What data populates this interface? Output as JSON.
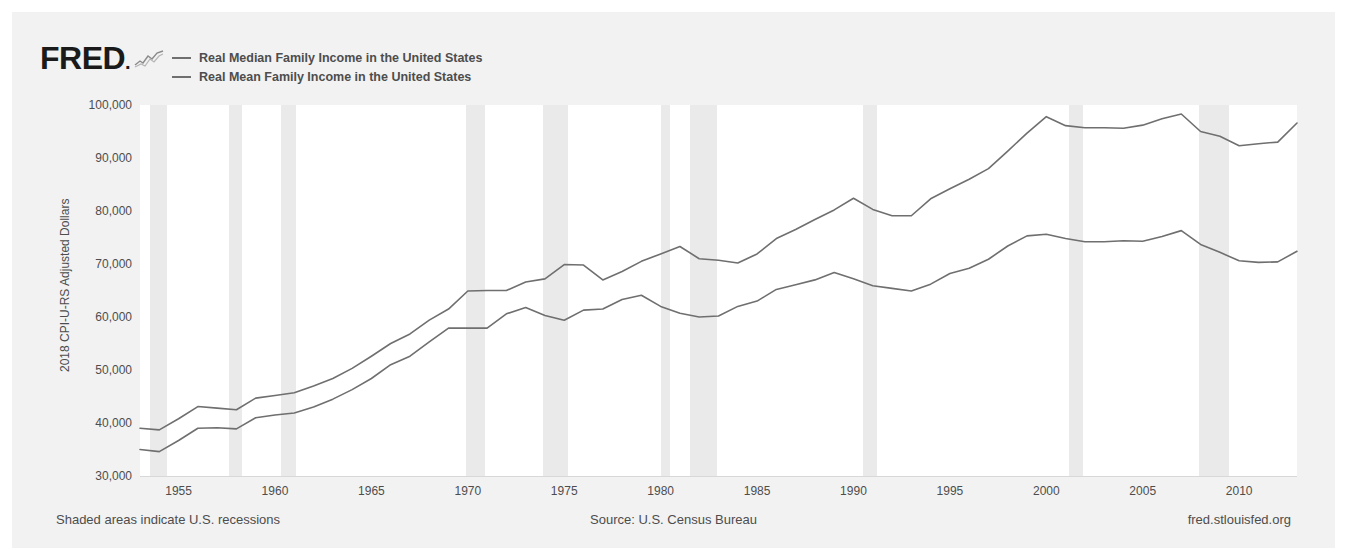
{
  "header": {
    "logo_text": "FRED",
    "logo_mark_icon": "sparkline-icon"
  },
  "legend": {
    "position": "top-left",
    "items": [
      {
        "label": "Real Median Family Income in the United States",
        "color": "#6f6f6f"
      },
      {
        "label": "Real Mean Family Income in the United States",
        "color": "#6f6f6f"
      }
    ]
  },
  "footer": {
    "left": "Shaded areas indicate U.S. recessions",
    "middle": "Source: U.S. Census Bureau",
    "right": "fred.stlouisfed.org"
  },
  "colors": {
    "line": "#6f6f6f",
    "recession_band": "#eaeaea",
    "plot_background": "#ffffff",
    "page_background": "#f2f2f2",
    "text": "#4d4d4d"
  },
  "chart_data": {
    "type": "line",
    "title": "",
    "subtitle": "",
    "xlabel": "",
    "ylabel": "2018 CPI-U-RS Adjusted Dollars",
    "xlim": [
      1953,
      2013
    ],
    "ylim": [
      30000,
      100000
    ],
    "grid": false,
    "legend_position": "top-left",
    "y_ticks": [
      100000,
      90000,
      80000,
      70000,
      60000,
      50000,
      40000,
      30000
    ],
    "y_tick_labels": [
      "100,000",
      "90,000",
      "80,000",
      "70,000",
      "60,000",
      "50,000",
      "40,000",
      "30,000"
    ],
    "x_ticks": [
      1955,
      1960,
      1965,
      1970,
      1975,
      1980,
      1985,
      1990,
      1995,
      2000,
      2005,
      2010
    ],
    "x_tick_labels": [
      "1955",
      "1960",
      "1965",
      "1970",
      "1975",
      "1980",
      "1985",
      "1990",
      "1995",
      "2000",
      "2005",
      "2010"
    ],
    "x": [
      1953,
      1954,
      1955,
      1956,
      1957,
      1958,
      1959,
      1960,
      1961,
      1962,
      1963,
      1964,
      1965,
      1966,
      1967,
      1968,
      1969,
      1970,
      1971,
      1972,
      1973,
      1974,
      1975,
      1976,
      1977,
      1978,
      1979,
      1980,
      1981,
      1982,
      1983,
      1984,
      1985,
      1986,
      1987,
      1988,
      1989,
      1990,
      1991,
      1992,
      1993,
      1994,
      1995,
      1996,
      1997,
      1998,
      1999,
      2000,
      2001,
      2002,
      2003,
      2004,
      2005,
      2006,
      2007,
      2008,
      2009,
      2010,
      2011,
      2012,
      2013
    ],
    "series": [
      {
        "name": "Real Mean Family Income in the United States",
        "color": "#6f6f6f",
        "values": [
          39000,
          38700,
          40800,
          43100,
          42800,
          42500,
          44700,
          45200,
          45700,
          47000,
          48400,
          50300,
          52600,
          55000,
          56800,
          59400,
          61500,
          64900,
          65000,
          65000,
          66600,
          67200,
          69900,
          69800,
          67000,
          68600,
          70500,
          71900,
          73300,
          71000,
          70700,
          70200,
          71900,
          74800,
          76500,
          78400,
          80200,
          82400,
          80300,
          79100,
          79100,
          82300,
          84200,
          86000,
          88000,
          91300,
          94700,
          97800,
          96100,
          95700,
          95700,
          95600,
          96200,
          97400,
          98300,
          95000,
          94100,
          92300,
          92700,
          93000,
          96600
        ]
      },
      {
        "name": "Real Median Family Income in the United States",
        "color": "#6f6f6f",
        "values": [
          35000,
          34600,
          36700,
          39000,
          39100,
          38900,
          41000,
          41500,
          41900,
          43000,
          44500,
          46300,
          48400,
          51000,
          52600,
          55300,
          57900,
          57900,
          57900,
          60600,
          61800,
          60300,
          59400,
          61300,
          61500,
          63300,
          64100,
          62000,
          60700,
          60000,
          60200,
          62000,
          63000,
          65200,
          66100,
          67000,
          68400,
          67200,
          65900,
          65400,
          64900,
          66200,
          68200,
          69200,
          70900,
          73400,
          75300,
          75600,
          74800,
          74200,
          74200,
          74400,
          74300,
          75200,
          76300,
          73700,
          72200,
          70600,
          70300,
          70400,
          72400
        ]
      }
    ],
    "recessions": [
      {
        "start": 1953.5,
        "end": 1954.4
      },
      {
        "start": 1957.6,
        "end": 1958.3
      },
      {
        "start": 1960.3,
        "end": 1961.1
      },
      {
        "start": 1969.9,
        "end": 1970.9
      },
      {
        "start": 1973.9,
        "end": 1975.2
      },
      {
        "start": 1980.0,
        "end": 1980.5
      },
      {
        "start": 1981.5,
        "end": 1982.9
      },
      {
        "start": 1990.5,
        "end": 1991.2
      },
      {
        "start": 2001.2,
        "end": 2001.9
      },
      {
        "start": 2007.9,
        "end": 2009.5
      }
    ]
  }
}
